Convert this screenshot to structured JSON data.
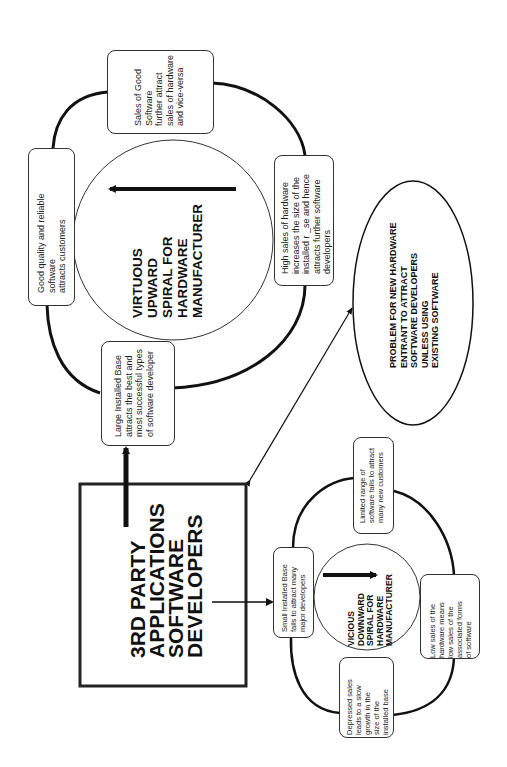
{
  "diagram": {
    "orientation": "rotated 90 degrees counter-clockwise",
    "virtuous_spiral": {
      "title": "VIRTUOUS\nUPWARD\nSPIRAL FOR\nHARDWARE\nMANUFACTURER",
      "boxes": [
        {
          "id": "good-software",
          "text": "Good quality and reliable\nsoftware\nattracts customers"
        },
        {
          "id": "sales-good-software",
          "text": "Sales of Good\nSoftware\nfurther attract\nsales of hardware\nand vice-versa"
        },
        {
          "id": "high-sales-hardware",
          "text": "High sales of hardware\nincreases the size of the\ninstalled r _se and hence\nattracts further software\ndevelopers"
        },
        {
          "id": "large-installed-base",
          "text": "Large Installed Base\nattracts the best and\nmost successful types\nof software developer"
        }
      ]
    },
    "third_party": {
      "title": "3RD PARTY\nAPPLICATIONS\nSOFTWARE\nDEVELOPERS"
    },
    "problem": {
      "text": "PROBLEM FOR NEW HARDWARE\nENTRANT TO ATTRACT\nSOFTWARE DEVELOPERS\nUNLESS USING\nEXISTING SOFTWARE"
    },
    "vicious_spiral": {
      "title": "VICIOUS\nDOWNWARD\nSPIRAL FOR\nHARDWARE\nMANUFACTURER",
      "boxes": [
        {
          "id": "small-installed-base",
          "text": "Small Installed Base\nfails to attract many\nmajor developers"
        },
        {
          "id": "limited-range",
          "text": "Limited range of\nsoftware fails to attract\nmany new customers"
        },
        {
          "id": "low-sales",
          "text": "Low sales of the\nhardware means\nlow sales of the\nassociated forms\nof software"
        },
        {
          "id": "depressed-sales",
          "text": "Depressed sales\nleads to a slow\ngrowth in the\nsize of the\ninstalled base"
        }
      ]
    },
    "colors": {
      "line": "#111111",
      "box_border": "#333333",
      "background": "#ffffff"
    }
  }
}
